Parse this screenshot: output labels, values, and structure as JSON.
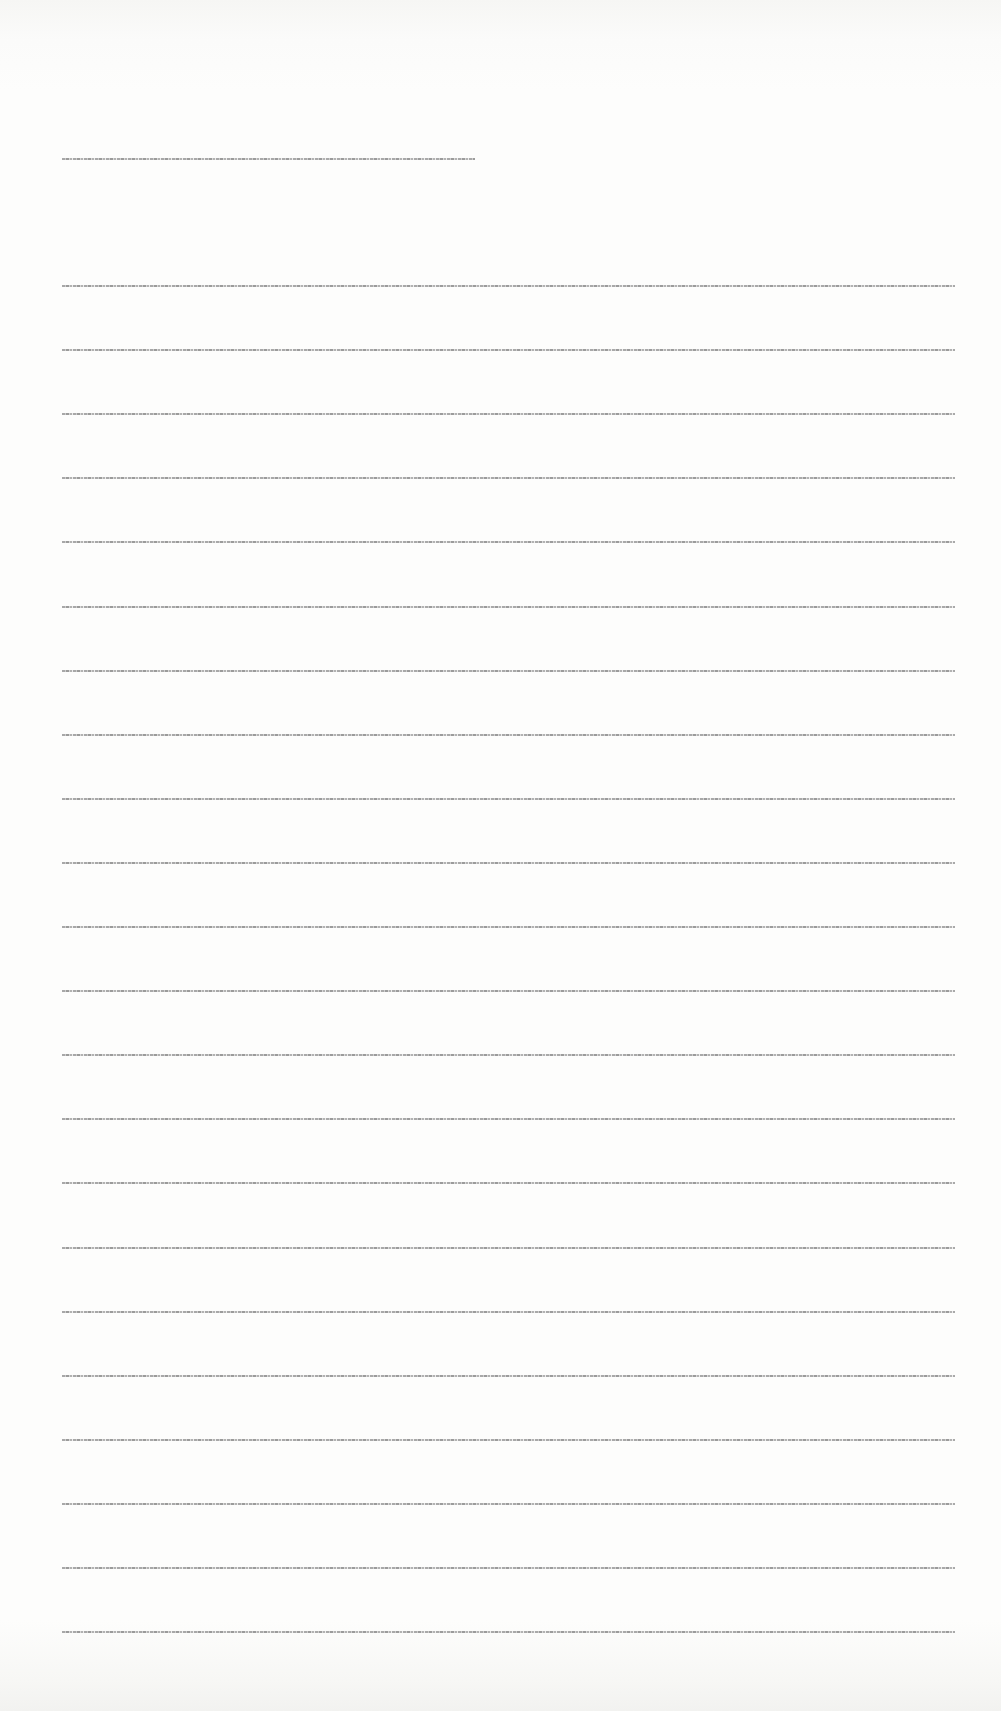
{
  "document": {
    "type": "scanned-page",
    "background_color": "#fdfdfc",
    "ink_color": "#9a9a9a",
    "heading": {
      "text": "[illegible — text rendered at sub-pixel size]"
    },
    "body_lines": [
      {
        "text": "[illegible line 1]"
      },
      {
        "text": "[illegible line 2]"
      },
      {
        "text": "[illegible line 3]"
      },
      {
        "text": "[illegible line 4]"
      },
      {
        "text": "[illegible line 5]"
      },
      {
        "text": "[illegible line 6]"
      },
      {
        "text": "[illegible line 7]"
      },
      {
        "text": "[illegible line 8]"
      },
      {
        "text": "[illegible line 9]"
      },
      {
        "text": "[illegible line 10]"
      },
      {
        "text": "[illegible line 11]"
      },
      {
        "text": "[illegible line 12]"
      },
      {
        "text": "[illegible line 13]"
      },
      {
        "text": "[illegible line 14]"
      },
      {
        "text": "[illegible line 15]"
      },
      {
        "text": "[illegible line 16]"
      },
      {
        "text": "[illegible line 17]"
      },
      {
        "text": "[illegible line 18]"
      },
      {
        "text": "[illegible line 19]"
      },
      {
        "text": "[illegible line 20]"
      },
      {
        "text": "[illegible line 21]"
      },
      {
        "text": "[illegible line 22]"
      }
    ]
  }
}
